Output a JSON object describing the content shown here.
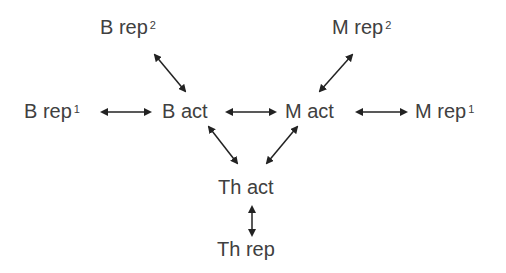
{
  "diagram": {
    "nodes": {
      "b_rep2": {
        "label": "B rep",
        "sup": "2"
      },
      "m_rep2": {
        "label": "M rep",
        "sup": "2"
      },
      "b_rep1": {
        "label": "B rep",
        "sup": "1"
      },
      "b_act": {
        "label": "B act"
      },
      "m_act": {
        "label": "M act"
      },
      "m_rep1": {
        "label": "M rep",
        "sup": "1"
      },
      "th_act": {
        "label": "Th act"
      },
      "th_rep": {
        "label": "Th rep"
      }
    },
    "edges": [
      {
        "from": "B rep2",
        "to": "B act",
        "type": "bidirectional"
      },
      {
        "from": "M rep2",
        "to": "M act",
        "type": "bidirectional"
      },
      {
        "from": "B rep1",
        "to": "B act",
        "type": "bidirectional"
      },
      {
        "from": "B act",
        "to": "M act",
        "type": "bidirectional"
      },
      {
        "from": "M act",
        "to": "M rep1",
        "type": "bidirectional"
      },
      {
        "from": "B act",
        "to": "Th act",
        "type": "bidirectional"
      },
      {
        "from": "M act",
        "to": "Th act",
        "type": "bidirectional"
      },
      {
        "from": "Th act",
        "to": "Th rep",
        "type": "bidirectional"
      }
    ],
    "colors": {
      "text": "#404040",
      "arrow": "#222222",
      "background": "#ffffff"
    }
  }
}
